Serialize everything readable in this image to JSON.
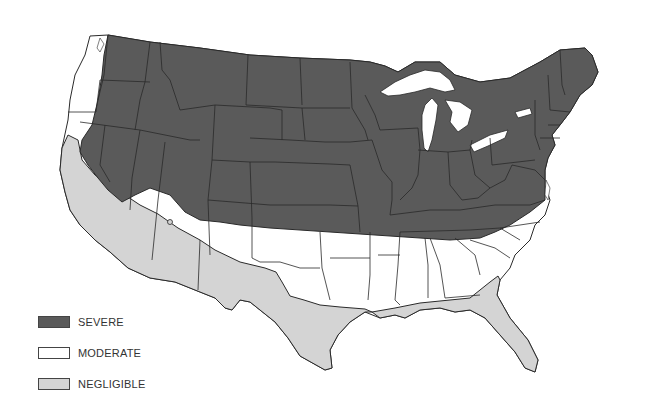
{
  "map": {
    "title": "",
    "region": "Contiguous United States",
    "colors": {
      "severe": "#5a5a5a",
      "moderate": "#ffffff",
      "negligible": "#d4d4d4",
      "border": "#2a2a2a",
      "water": "#ffffff"
    }
  },
  "legend": {
    "items": [
      {
        "label": "SEVERE",
        "color": "#5a5a5a"
      },
      {
        "label": "MODERATE",
        "color": "#ffffff"
      },
      {
        "label": "NEGLIGIBLE",
        "color": "#d4d4d4"
      }
    ]
  }
}
